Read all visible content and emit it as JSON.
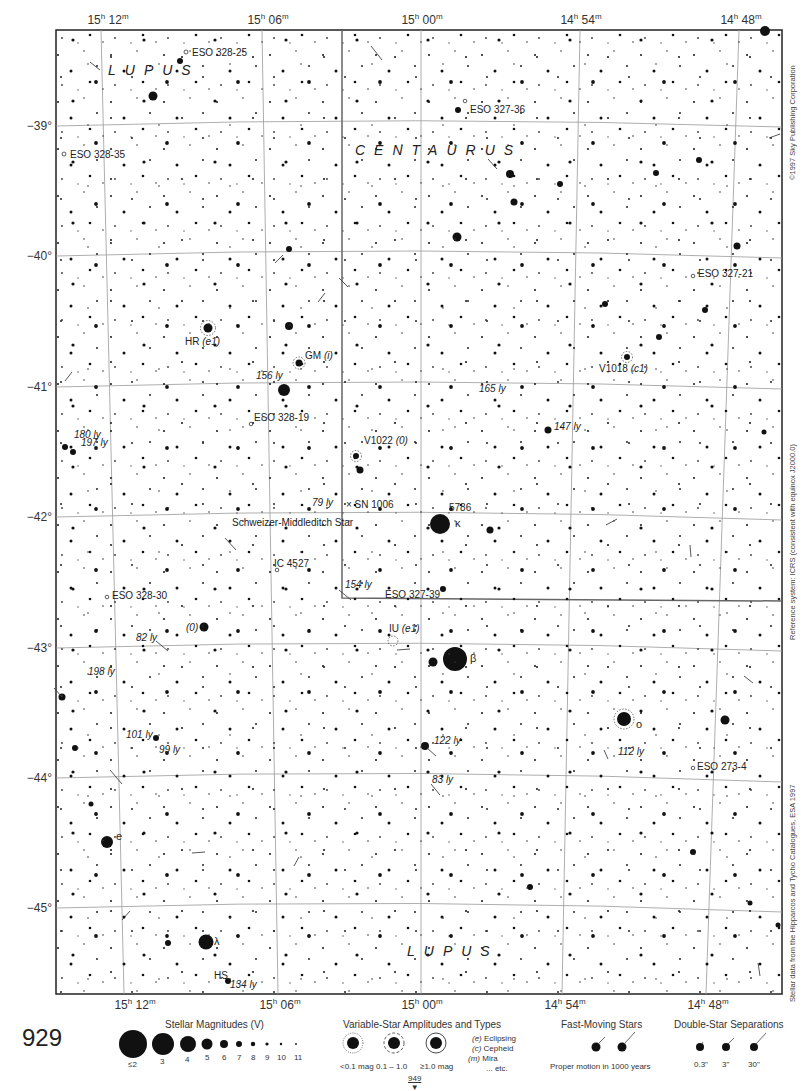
{
  "page": {
    "number": "929",
    "next_page_ref": "949"
  },
  "ra_labels": [
    {
      "text": "15",
      "unit_h": "h",
      "min": "12",
      "unit_m": "m",
      "x_top": 108,
      "x_bottom": 135
    },
    {
      "text": "15",
      "unit_h": "h",
      "min": "06",
      "unit_m": "m",
      "x_top": 268,
      "x_bottom": 280
    },
    {
      "text": "15",
      "unit_h": "h",
      "min": "00",
      "unit_m": "m",
      "x_top": 422,
      "x_bottom": 422
    },
    {
      "text": "14",
      "unit_h": "h",
      "min": "54",
      "unit_m": "m",
      "x_top": 581,
      "x_bottom": 565
    },
    {
      "text": "14",
      "unit_h": "h",
      "min": "48",
      "unit_m": "m",
      "x_top": 741,
      "x_bottom": 708
    }
  ],
  "dec_labels": [
    {
      "text": "−39°",
      "y": 126
    },
    {
      "text": "−40°",
      "y": 256
    },
    {
      "text": "−41°",
      "y": 387
    },
    {
      "text": "−42°",
      "y": 517
    },
    {
      "text": "−43°",
      "y": 648
    },
    {
      "text": "−44°",
      "y": 778
    },
    {
      "text": "−45°",
      "y": 908
    }
  ],
  "constellations": [
    {
      "name": "LUPUS",
      "x": 108,
      "y": 62
    },
    {
      "name": "CENTAURUS",
      "x": 355,
      "y": 142
    },
    {
      "name": "LUPUS",
      "x": 407,
      "y": 943
    }
  ],
  "objects": [
    {
      "text": "ESO 328-25",
      "x": 192,
      "y": 48,
      "italic_part": ""
    },
    {
      "text": "ESO 327-36",
      "x": 470,
      "y": 105,
      "italic_part": ""
    },
    {
      "text": "ESO 328-35",
      "x": 70,
      "y": 150,
      "italic_part": ""
    },
    {
      "text": "ESO 327-21",
      "x": 698,
      "y": 269,
      "italic_part": ""
    },
    {
      "text": "HR",
      "x": 185,
      "y": 337,
      "italic_part": "(e1)"
    },
    {
      "text": "GM",
      "x": 305,
      "y": 351,
      "italic_part": "(i)"
    },
    {
      "text": "V1018",
      "x": 599,
      "y": 364,
      "italic_part": "(c1)"
    },
    {
      "text": "ESO 328-19",
      "x": 254,
      "y": 413,
      "italic_part": ""
    },
    {
      "text": "V1022",
      "x": 364,
      "y": 436,
      "italic_part": "(0)"
    },
    {
      "text": "× SN 1006",
      "x": 346,
      "y": 500,
      "italic_part": ""
    },
    {
      "text": "5786",
      "x": 449,
      "y": 503,
      "italic_part": ""
    },
    {
      "text": "Schweizer-Middleditch Star",
      "x": 232,
      "y": 518,
      "italic_part": ""
    },
    {
      "text": "IC 4527",
      "x": 274,
      "y": 559,
      "italic_part": ""
    },
    {
      "text": "ESO 328-30",
      "x": 112,
      "y": 591,
      "italic_part": ""
    },
    {
      "text": "ESO 327-39",
      "x": 385,
      "y": 590,
      "italic_part": ""
    },
    {
      "text": "IU",
      "x": 389,
      "y": 624,
      "italic_part": "(e1)"
    },
    {
      "text": "",
      "x": 186,
      "y": 623,
      "italic_part": "(0)"
    },
    {
      "text": "ESO 273-4",
      "x": 697,
      "y": 762,
      "italic_part": ""
    },
    {
      "text": "HS",
      "x": 214,
      "y": 971,
      "italic_part": ""
    }
  ],
  "greek_letters": [
    {
      "text": "κ",
      "x": 455,
      "y": 518
    },
    {
      "text": "β",
      "x": 470,
      "y": 653
    },
    {
      "text": "o",
      "x": 636,
      "y": 719
    },
    {
      "text": "e",
      "x": 116,
      "y": 831
    },
    {
      "text": "λ",
      "x": 214,
      "y": 936
    }
  ],
  "distances": [
    {
      "text": "165 ly",
      "x": 479,
      "y": 384
    },
    {
      "text": "147 ly",
      "x": 554,
      "y": 422
    },
    {
      "text": "156 ly",
      "x": 256,
      "y": 371
    },
    {
      "text": "180 ly",
      "x": 74,
      "y": 430
    },
    {
      "text": "197 ly",
      "x": 81,
      "y": 438
    },
    {
      "text": "79 ly",
      "x": 312,
      "y": 498
    },
    {
      "text": "154 ly",
      "x": 345,
      "y": 580
    },
    {
      "text": "82 ly",
      "x": 136,
      "y": 633
    },
    {
      "text": "198 ly",
      "x": 88,
      "y": 667
    },
    {
      "text": "101 ly",
      "x": 126,
      "y": 730
    },
    {
      "text": "99 ly",
      "x": 159,
      "y": 745
    },
    {
      "text": "122 ly",
      "x": 434,
      "y": 736
    },
    {
      "text": "112 ly",
      "x": 618,
      "y": 747
    },
    {
      "text": "83 ly",
      "x": 432,
      "y": 775
    },
    {
      "text": "134 ly",
      "x": 230,
      "y": 980
    }
  ],
  "side_credits": {
    "copyright": "©1997 Sky Publishing Corporation",
    "reference": "Reference system: ICRS (consistent with equinox J2000.0)",
    "data_source": "Stellar data from the Hipparcos and Tycho Catalogues, ESA 1997"
  },
  "legend": {
    "magnitudes": {
      "title": "Stellar Magnitudes (V)",
      "items": [
        {
          "label": "≤2",
          "r": 14
        },
        {
          "label": "3",
          "r": 11
        },
        {
          "label": "4",
          "r": 8
        },
        {
          "label": "5",
          "r": 6
        },
        {
          "label": "6",
          "r": 4.5
        },
        {
          "label": "7",
          "r": 3.5
        },
        {
          "label": "8",
          "r": 2.5
        },
        {
          "label": "9",
          "r": 2
        },
        {
          "label": "10",
          "r": 1.5
        },
        {
          "label": "11",
          "r": 1
        }
      ]
    },
    "variables": {
      "title": "Variable-Star Amplitudes and Types",
      "items": [
        {
          "label": "<0.1 mag"
        },
        {
          "label": "0.1 – 1.0"
        },
        {
          "label": "≥1.0 mag"
        }
      ],
      "types": [
        {
          "code": "(e)",
          "name": "Eclipsing"
        },
        {
          "code": "(c)",
          "name": "Cepheid"
        },
        {
          "code": "(m)",
          "name": "Mira"
        },
        {
          "code": "",
          "name": "... etc."
        }
      ]
    },
    "fast_moving": {
      "title": "Fast-Moving Stars",
      "caption": "Proper motion in 1000 years"
    },
    "doubles": {
      "title": "Double-Star Separations",
      "items": [
        {
          "label": "0.3\""
        },
        {
          "label": "3\""
        },
        {
          "label": "30\""
        }
      ]
    }
  },
  "colors": {
    "ink": "#111111",
    "grid": "#888888",
    "border": "#222222"
  }
}
